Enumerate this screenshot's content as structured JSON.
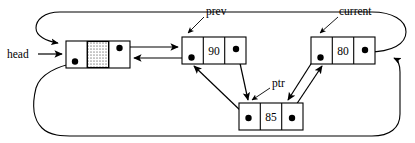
{
  "diagram": {
    "background_color": "#ffffff",
    "line_color": "#000000",
    "hatch_color": "#b0b0b0",
    "labels": {
      "head": "head",
      "prev": "prev",
      "current": "current",
      "ptr": "ptr"
    },
    "nodes": [
      {
        "id": "head-node",
        "name": "head-node",
        "value": "",
        "has_hatched_cell": true,
        "x": 66,
        "y": 41,
        "width": 64,
        "height": 27
      },
      {
        "id": "prev-node",
        "name": "prev-node",
        "value": "90",
        "has_hatched_cell": false,
        "x": 182,
        "y": 37,
        "width": 64,
        "height": 27
      },
      {
        "id": "current-node",
        "name": "current-node",
        "value": "80",
        "has_hatched_cell": false,
        "x": 311,
        "y": 37,
        "width": 64,
        "height": 27
      },
      {
        "id": "ptr-node",
        "name": "ptr-node",
        "value": "85",
        "has_hatched_cell": false,
        "x": 239,
        "y": 103,
        "width": 64,
        "height": 27
      }
    ]
  }
}
